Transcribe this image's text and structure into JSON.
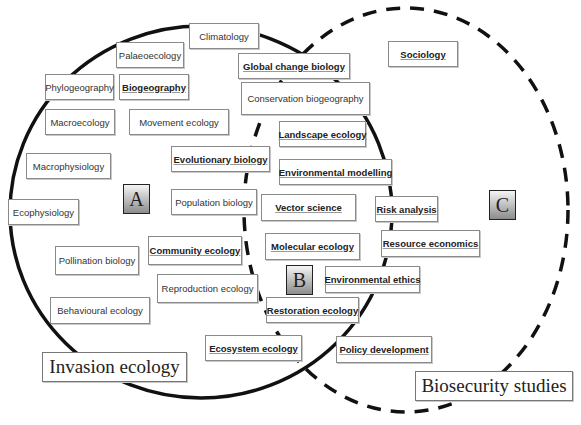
{
  "circles": {
    "invasion": {
      "label": "Invasion ecology",
      "stroke": "#111111",
      "style": "solid"
    },
    "biosecurity": {
      "label": "Biosecurity studies",
      "stroke": "#111111",
      "style": "dashed"
    }
  },
  "regions": {
    "A": "A",
    "B": "B",
    "C": "C"
  },
  "topics": {
    "climatology": "Climatology",
    "palaeoecology": "Palaeoecology",
    "phylogeography": "Phylogeography",
    "biogeography": "Biogeography",
    "macroecology": "Macroecology",
    "movement_ecology": "Movement ecology",
    "macrophysiology": "Macrophysiology",
    "ecophysiology": "Ecophysiology",
    "evolutionary_biology": "Evolutionary biology",
    "population_biology": "Population biology",
    "community_ecology": "Community ecology",
    "pollination_biology": "Pollination biology",
    "reproduction_ecology": "Reproduction ecology",
    "behavioural_ecology": "Behavioural ecology",
    "ecosystem_ecology": "Ecosystem ecology",
    "global_change_biology": "Global change biology",
    "conservation_biogeography": "Conservation biogeography",
    "landscape_ecology": "Landscape ecology",
    "environmental_modelling": "Environmental modelling",
    "vector_science": "Vector science",
    "molecular_ecology": "Molecular ecology",
    "restoration_ecology": "Restoration ecology",
    "risk_analysis": "Risk analysis",
    "resource_economics": "Resource economics",
    "environmental_ethics": "Environmental ethics",
    "policy_development": "Policy development",
    "sociology": "Sociology"
  }
}
